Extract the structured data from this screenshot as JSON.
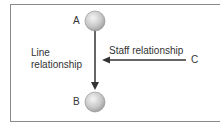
{
  "diagram": {
    "nodes": [
      {
        "id": "A",
        "label": "A"
      },
      {
        "id": "B",
        "label": "B"
      },
      {
        "id": "C",
        "label": "C"
      }
    ],
    "edges": [
      {
        "from": "A",
        "to": "B",
        "label_line1": "Line",
        "label_line2": "relationship",
        "type": "line"
      },
      {
        "from": "C",
        "to": "A-B line",
        "label": "Staff relationship",
        "type": "staff"
      }
    ]
  }
}
